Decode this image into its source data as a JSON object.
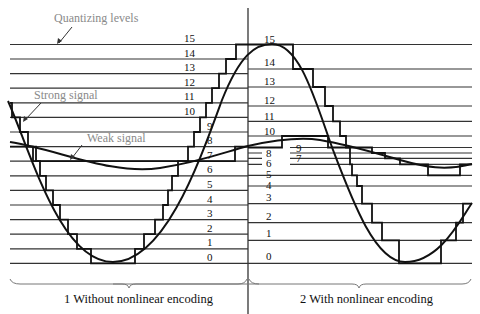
{
  "annotations": {
    "quantizing_levels": "Quantizing levels",
    "strong_signal": "Strong signal",
    "weak_signal": "Weak signal"
  },
  "captions": {
    "left": "1 Without nonlinear encoding",
    "right": "2 With nonlinear encoding"
  },
  "left_panel": {
    "title": "Without nonlinear encoding",
    "level_labels": [
      "15",
      "14",
      "13",
      "12",
      "11",
      "10",
      "9",
      "8",
      "7",
      "6",
      "5",
      "4",
      "3",
      "2",
      "1",
      "0"
    ],
    "level_count": 16,
    "spacing": "uniform"
  },
  "right_panel": {
    "title": "With nonlinear encoding",
    "level_labels": [
      "15",
      "14",
      "13",
      "12",
      "11",
      "10",
      "9",
      "8",
      "7",
      "6",
      "5",
      "4",
      "3",
      "2",
      "1",
      "0"
    ],
    "level_count": 16,
    "spacing": "nonuniform (compressed near center)"
  },
  "colors": {
    "line": "#333333",
    "wave": "#111111",
    "annotation": "#8a8a8a"
  }
}
